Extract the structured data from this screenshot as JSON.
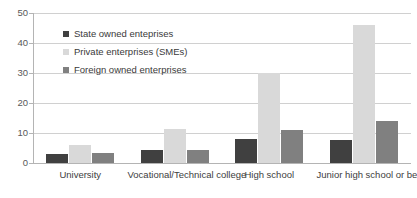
{
  "chart_data": {
    "type": "bar",
    "title": "",
    "subtitle": "",
    "xlabel": "",
    "ylabel": "",
    "ylim": [
      0,
      50
    ],
    "yticks": [
      0,
      10,
      20,
      30,
      40,
      50
    ],
    "ytick_labels": [
      "0",
      "10",
      "20",
      "30",
      "40",
      "50"
    ],
    "grid": true,
    "legend_position": "inside-top-left",
    "categories": [
      "University",
      "Vocational/Technical college",
      "High school",
      "Junior high school or below"
    ],
    "series": [
      {
        "name": "State owned enteprises",
        "color": "#404040",
        "values": [
          3,
          4.3,
          8,
          7.7
        ]
      },
      {
        "name": "Private enterprises (SMEs)",
        "color": "#d9d9d9",
        "values": [
          6,
          11.2,
          30,
          46
        ]
      },
      {
        "name": "Foreign owned enterprises",
        "color": "#808080",
        "values": [
          3.4,
          4.2,
          11,
          14
        ]
      }
    ]
  },
  "colors": {
    "series_1": "#404040",
    "series_2": "#d9d9d9",
    "series_3": "#808080",
    "gridline": "#d0d0d0",
    "axis": "#b4b4b4",
    "tick_label": "#595959",
    "category_label": "#404040",
    "background": "#ffffff"
  }
}
